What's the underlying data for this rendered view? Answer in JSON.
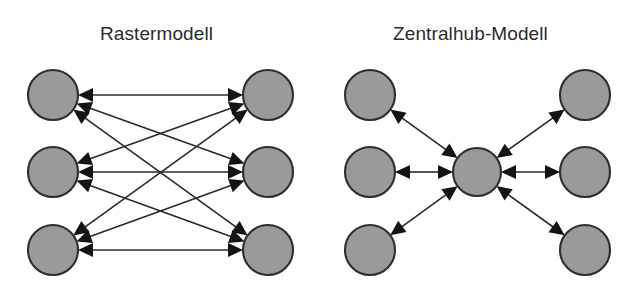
{
  "figure": {
    "panels": [
      {
        "id": "raster",
        "title": "Rastermodell",
        "topology": "full-mesh",
        "node_count": 6,
        "link_count": 9,
        "link_style": "bidirectional",
        "nodes": [
          {
            "name": "left-node-1",
            "cx": 53,
            "cy": 95,
            "r": 25
          },
          {
            "name": "left-node-2",
            "cx": 53,
            "cy": 172,
            "r": 25
          },
          {
            "name": "left-node-3",
            "cx": 53,
            "cy": 250,
            "r": 25
          },
          {
            "name": "right-node-1",
            "cx": 268,
            "cy": 95,
            "r": 25
          },
          {
            "name": "right-node-2",
            "cx": 268,
            "cy": 172,
            "r": 25
          },
          {
            "name": "right-node-3",
            "cx": 268,
            "cy": 250,
            "r": 25
          }
        ],
        "links": [
          {
            "from": "left-node-1",
            "to": "right-node-1"
          },
          {
            "from": "left-node-1",
            "to": "right-node-2"
          },
          {
            "from": "left-node-1",
            "to": "right-node-3"
          },
          {
            "from": "left-node-2",
            "to": "right-node-1"
          },
          {
            "from": "left-node-2",
            "to": "right-node-2"
          },
          {
            "from": "left-node-2",
            "to": "right-node-3"
          },
          {
            "from": "left-node-3",
            "to": "right-node-1"
          },
          {
            "from": "left-node-3",
            "to": "right-node-2"
          },
          {
            "from": "left-node-3",
            "to": "right-node-3"
          }
        ]
      },
      {
        "id": "zentralhub",
        "title": "Zentralhub-Modell",
        "topology": "hub-and-spoke",
        "node_count": 7,
        "link_count": 6,
        "link_style": "bidirectional",
        "nodes": [
          {
            "name": "hub-node",
            "cx": 477,
            "cy": 172,
            "r": 24
          },
          {
            "name": "spoke-node-top-left",
            "cx": 370,
            "cy": 95,
            "r": 25
          },
          {
            "name": "spoke-node-middle-left",
            "cx": 370,
            "cy": 172,
            "r": 25
          },
          {
            "name": "spoke-node-bottom-left",
            "cx": 370,
            "cy": 250,
            "r": 25
          },
          {
            "name": "spoke-node-top-right",
            "cx": 585,
            "cy": 95,
            "r": 25
          },
          {
            "name": "spoke-node-middle-right",
            "cx": 585,
            "cy": 172,
            "r": 25
          },
          {
            "name": "spoke-node-bottom-right",
            "cx": 585,
            "cy": 250,
            "r": 25
          }
        ],
        "links": [
          {
            "from": "hub-node",
            "to": "spoke-node-top-left"
          },
          {
            "from": "hub-node",
            "to": "spoke-node-middle-left"
          },
          {
            "from": "hub-node",
            "to": "spoke-node-bottom-left"
          },
          {
            "from": "hub-node",
            "to": "spoke-node-top-right"
          },
          {
            "from": "hub-node",
            "to": "spoke-node-middle-right"
          },
          {
            "from": "hub-node",
            "to": "spoke-node-bottom-right"
          }
        ]
      }
    ],
    "colors": {
      "node_fill": "#9a9a9a",
      "node_stroke": "#2e2e2e",
      "link": "#2a2a2a",
      "arrow": "#141414",
      "background": "#ffffff",
      "title_text": "#2b2b2b"
    },
    "arrow": {
      "length": 15,
      "half_width": 7
    }
  }
}
